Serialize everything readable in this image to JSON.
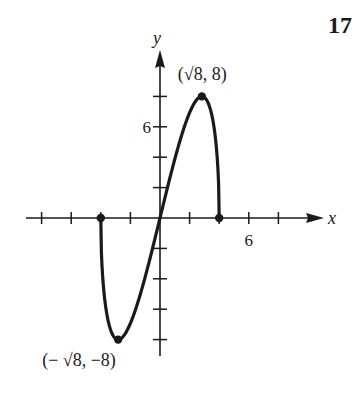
{
  "problem_number": "17",
  "chart_data": {
    "type": "line",
    "title": "",
    "function": "f(x) = x·sqrt(16 − x²)",
    "xlabel": "x",
    "ylabel": "y",
    "x_tick_step": 2,
    "y_tick_step": 2,
    "x_tick_labels": [
      {
        "value": 6,
        "label": "6"
      }
    ],
    "y_tick_labels": [
      {
        "value": 6,
        "label": "6"
      }
    ],
    "xlim": [
      -9,
      11
    ],
    "ylim": [
      -9,
      11
    ],
    "grid": false,
    "x": [
      -4,
      -3.5,
      -3,
      -2.828,
      -2.5,
      -2,
      -1.5,
      -1,
      -0.5,
      0,
      0.5,
      1,
      1.5,
      2,
      2.5,
      2.828,
      3,
      3.5,
      4
    ],
    "y": [
      0,
      -6.78,
      -7.94,
      -8,
      -7.81,
      -6.93,
      -5.56,
      -3.87,
      -1.98,
      0,
      1.98,
      3.87,
      5.56,
      6.93,
      7.81,
      8,
      7.94,
      6.78,
      0
    ],
    "points": [
      {
        "x": -4,
        "y": 0,
        "label": ""
      },
      {
        "x": 4,
        "y": 0,
        "label": ""
      },
      {
        "x": 2.828,
        "y": 8,
        "label": "(√8, 8)"
      },
      {
        "x": -2.828,
        "y": -8,
        "label": "(− √8, −8)"
      }
    ],
    "colors": {
      "ink": "#1a1a1a"
    }
  }
}
